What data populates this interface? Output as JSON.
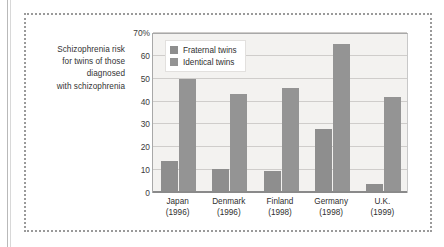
{
  "caption": {
    "lines": [
      "Schizophrenia risk",
      "for twins of those",
      "diagnosed",
      "with schizophrenia"
    ]
  },
  "colors": {
    "fraternal": "#8e8e8e",
    "identical": "#949494",
    "plot_background": "#f3f2f0",
    "gridline": "#cfcdcb",
    "axis": "#8a8a8a",
    "frame_dotted": "#9a9a9a"
  },
  "chart_data": {
    "type": "bar",
    "title": "Schizophrenia risk for twins of those diagnosed with schizophrenia",
    "xlabel": "",
    "ylabel": "",
    "ylim": [
      0,
      70
    ],
    "yticks": [
      0,
      10,
      20,
      30,
      40,
      50,
      60,
      70
    ],
    "ytick_labels": [
      "0",
      "10",
      "20",
      "30",
      "40",
      "50",
      "60",
      "70%"
    ],
    "grid": true,
    "legend_position": "top-left",
    "categories": [
      "Japan",
      "Denmark",
      "Finland",
      "Germany",
      "U.K."
    ],
    "category_years": [
      "(1996)",
      "(1996)",
      "(1998)",
      "(1998)",
      "(1999)"
    ],
    "series": [
      {
        "name": "Fraternal twins",
        "values": [
          14,
          10.5,
          9.5,
          28,
          4
        ]
      },
      {
        "name": "Identical twins",
        "values": [
          50,
          43.5,
          46,
          65,
          42
        ]
      }
    ]
  }
}
